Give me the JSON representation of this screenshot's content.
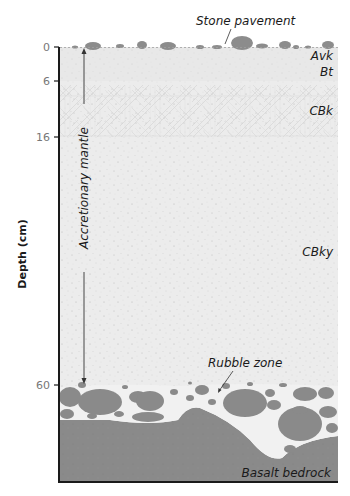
{
  "figure": {
    "type": "soil-profile-diagram",
    "axis": {
      "title": "Depth (cm)",
      "ticks": [
        {
          "label": "0",
          "depth": 0
        },
        {
          "label": "6",
          "depth": 6
        },
        {
          "label": "16",
          "depth": 16
        },
        {
          "label": "60",
          "depth": 60
        }
      ]
    },
    "horizons": [
      {
        "label": "Avk",
        "top": 0,
        "bottom": 3
      },
      {
        "label": "Bt",
        "top": 3,
        "bottom": 6
      },
      {
        "label": "CBk",
        "top": 6,
        "bottom": 16
      },
      {
        "label": "CBky",
        "top": 16,
        "bottom": 60
      }
    ],
    "annotations": {
      "stone_pavement": "Stone pavement",
      "accretionary_mantle": "Accretionary mantle",
      "rubble_zone": "Rubble zone",
      "bedrock": "Basalt bedrock"
    },
    "colors": {
      "soil_fill": "#ececec",
      "cbk_fill": "#e6e6e6",
      "stone": "#8c8c8c",
      "bedrock": "#8a8a8a",
      "rubble_matrix": "#f1f1f1",
      "axis": "#1a1a1a"
    }
  }
}
